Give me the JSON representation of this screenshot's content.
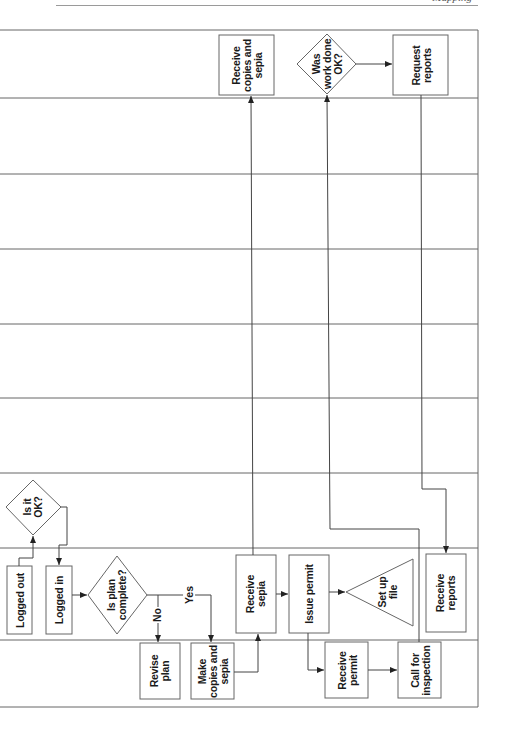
{
  "page": {
    "header_text": "Mapping"
  },
  "diagram": {
    "orientation": "rotated-90-ccw",
    "lane_count": 9,
    "lane_boundaries_y": [
      30,
      98,
      174,
      249,
      324,
      398,
      473,
      548,
      640,
      707
    ],
    "colors": {
      "stroke": "#555555",
      "text": "#1a1a1a",
      "background": "#ffffff"
    },
    "nodes": [
      {
        "id": "logged_out",
        "shape": "rect",
        "label": "Logged out"
      },
      {
        "id": "is_it_ok",
        "shape": "diamond",
        "label": "Is it\nOK?"
      },
      {
        "id": "logged_in",
        "shape": "rect",
        "label": "Logged in"
      },
      {
        "id": "is_plan_complete",
        "shape": "diamond",
        "label": "Is plan\ncomplete?"
      },
      {
        "id": "revise_plan",
        "shape": "rect",
        "label": "Revise\nplan"
      },
      {
        "id": "make_copies",
        "shape": "rect",
        "label": "Make\ncopies and\nsepia"
      },
      {
        "id": "receive_sepia",
        "shape": "rect",
        "label": "Receive\nsepia"
      },
      {
        "id": "receive_copies",
        "shape": "rect",
        "label": "Receive\ncopies and\nsepia"
      },
      {
        "id": "issue_permit",
        "shape": "rect",
        "label": "Issue permit"
      },
      {
        "id": "set_up_file",
        "shape": "triangle",
        "label": "Set up\nfile"
      },
      {
        "id": "receive_permit",
        "shape": "rect",
        "label": "Receive\npermit"
      },
      {
        "id": "call_inspection",
        "shape": "rect",
        "label": "Call for\ninspection"
      },
      {
        "id": "was_work_ok",
        "shape": "diamond",
        "label": "Was\nwork done\nOK?"
      },
      {
        "id": "request_reports",
        "shape": "rect",
        "label": "Request\nreports"
      },
      {
        "id": "receive_reports",
        "shape": "rect",
        "label": "Receive\nreports"
      }
    ],
    "edges": [
      {
        "from": "logged_out",
        "to": "is_it_ok",
        "label": ""
      },
      {
        "from": "is_it_ok",
        "to": "logged_in",
        "label": ""
      },
      {
        "from": "logged_in",
        "to": "is_plan_complete",
        "label": ""
      },
      {
        "from": "is_plan_complete",
        "to": "revise_plan",
        "label": "No"
      },
      {
        "from": "is_plan_complete",
        "to": "make_copies",
        "label": "Yes"
      },
      {
        "from": "make_copies",
        "to": "receive_sepia",
        "label": ""
      },
      {
        "from": "receive_sepia",
        "to": "receive_copies",
        "label": ""
      },
      {
        "from": "receive_sepia",
        "to": "issue_permit",
        "label": ""
      },
      {
        "from": "issue_permit",
        "to": "set_up_file",
        "label": ""
      },
      {
        "from": "issue_permit",
        "to": "receive_permit",
        "label": ""
      },
      {
        "from": "receive_permit",
        "to": "call_inspection",
        "label": ""
      },
      {
        "from": "call_inspection",
        "to": "was_work_ok",
        "label": ""
      },
      {
        "from": "was_work_ok",
        "to": "request_reports",
        "label": ""
      },
      {
        "from": "request_reports",
        "to": "receive_reports",
        "label": ""
      }
    ],
    "edge_labels": {
      "no": "No",
      "yes": "Yes"
    }
  }
}
